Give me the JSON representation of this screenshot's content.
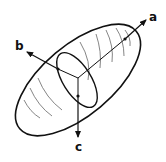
{
  "diagram": {
    "axes": [
      {
        "id": "a",
        "label": "a"
      },
      {
        "id": "b",
        "label": "b"
      },
      {
        "id": "c",
        "label": "c"
      }
    ],
    "colors": {
      "stroke": "#111111",
      "contour": "#555555",
      "background": "#ffffff"
    }
  }
}
